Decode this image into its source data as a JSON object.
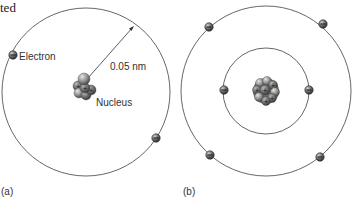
{
  "header_fragment": "ted",
  "panel_a": {
    "caption": "(a)",
    "electron_label": "Electron",
    "nucleus_label": "Nucleus",
    "radius_label": "0.05 nm",
    "orbit": {
      "cx": 86,
      "cy": 92,
      "r": 84
    },
    "electrons": [
      {
        "x": 13,
        "y": 55
      },
      {
        "x": 156,
        "y": 138
      }
    ]
  },
  "panel_b": {
    "caption": "(b)",
    "outer_orbit": {
      "cx": 266,
      "cy": 91,
      "r": 85
    },
    "inner_orbit": {
      "cx": 266,
      "cy": 91,
      "r": 43
    },
    "outer_electrons": [
      {
        "x": 209,
        "y": 27
      },
      {
        "x": 323,
        "y": 24
      },
      {
        "x": 210,
        "y": 155
      },
      {
        "x": 320,
        "y": 157
      }
    ],
    "inner_electrons": [
      {
        "x": 224,
        "y": 90
      },
      {
        "x": 309,
        "y": 90
      }
    ]
  },
  "colors": {
    "orbit": "#555555",
    "electron_dark": "#3a3a3a",
    "electron_light": "#9a9a9a",
    "nucleus_dark": "#555555",
    "nucleus_light": "#c8c8c8",
    "text": "#333333"
  }
}
